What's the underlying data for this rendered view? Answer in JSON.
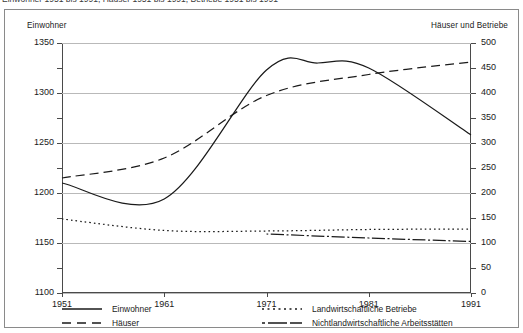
{
  "caption": "Einwohner 1951 bis 1991, Häuser 1951 bis 1991, Betriebe 1951 bis 1991",
  "axes": {
    "left_title": "Einwohner",
    "right_title": "Häuser und Betriebe",
    "left_ticks": [
      "1350",
      "1300",
      "1250",
      "1200",
      "1150",
      "1100"
    ],
    "right_ticks": [
      "500",
      "450",
      "400",
      "350",
      "300",
      "250",
      "200",
      "150",
      "100",
      "50",
      "0"
    ],
    "x_ticks": [
      "1951",
      "1961",
      "1971",
      "1981",
      "1991"
    ]
  },
  "legend": {
    "items": [
      {
        "label": "Einwohner",
        "style": "solid"
      },
      {
        "label": "Landwirtschaftliche Betriebe",
        "style": "dotted"
      },
      {
        "label": "Häuser",
        "style": "dashed"
      },
      {
        "label": "Nichtlandwirtschaftliche Arbeitsstätten",
        "style": "dashdot"
      }
    ]
  },
  "colors": {
    "line": "#1a1a1a",
    "grid": "#b9b9b9",
    "axis": "#4a4a4a",
    "frame": "#8a8a8a",
    "background": "#ffffff"
  },
  "chart_data": {
    "type": "line",
    "xlabel": "",
    "ylabel": "Einwohner",
    "y2label": "Häuser und Betriebe",
    "x": [
      1951,
      1961,
      1971,
      1981,
      1991
    ],
    "xlim": [
      1951,
      1991
    ],
    "ylim": [
      1100,
      1350
    ],
    "y2lim": [
      0,
      500
    ],
    "ytick_step": 50,
    "ytick_minor_step": 25,
    "y2tick_step": 50,
    "grid": true,
    "legend_position": "below",
    "series": [
      {
        "name": "Einwohner",
        "axis": "left",
        "style": "solid",
        "x": [
          1951,
          1961,
          1971,
          1976,
          1981,
          1991
        ],
        "values": [
          1210,
          1194,
          1323,
          1330,
          1325,
          1258
        ]
      },
      {
        "name": "Häuser",
        "axis": "right",
        "style": "dashed",
        "x": [
          1951,
          1961,
          1971,
          1981,
          1991
        ],
        "values": [
          230,
          270,
          395,
          437,
          462
        ]
      },
      {
        "name": "Landwirtschaftliche Betriebe",
        "axis": "right",
        "style": "dotted",
        "x": [
          1951,
          1961,
          1971,
          1981,
          1991
        ],
        "values": [
          148,
          125,
          124,
          127,
          128
        ]
      },
      {
        "name": "Nichtlandwirtschaftliche Arbeitsstätten",
        "axis": "right",
        "style": "dashdot",
        "x": [
          1971,
          1981,
          1991
        ],
        "values": [
          118,
          110,
          103
        ]
      }
    ]
  }
}
